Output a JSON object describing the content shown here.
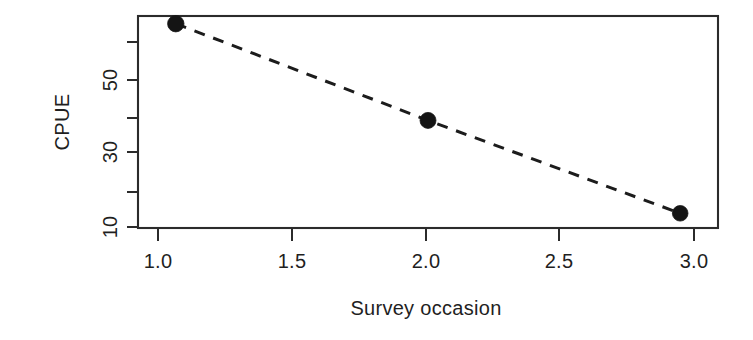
{
  "chart_data": {
    "type": "line",
    "title": "",
    "subtitle": "",
    "xlabel": "Survey occasion",
    "ylabel": "CPUE",
    "x": [
      1.0,
      2.0,
      3.0
    ],
    "values": [
      63,
      24,
      9.5
    ],
    "series": [
      {
        "name": "CPUE",
        "x": [
          1.0,
          2.0,
          3.0
        ],
        "values": [
          63,
          24,
          9.5
        ],
        "marker": "filled-circle",
        "linestyle": "dashed",
        "color": "#141414"
      }
    ],
    "xlim": [
      0.85,
      3.15
    ],
    "ylim": [
      8.2,
      68
    ],
    "yscale": "log",
    "xscale": "linear",
    "grid": false,
    "legend": false,
    "legend_position": "none",
    "frame": "box",
    "xticks": [
      {
        "value": 1.0,
        "label": "1.0"
      },
      {
        "value": 1.5,
        "label": "1.5"
      },
      {
        "value": 2.0,
        "label": "2.0"
      },
      {
        "value": 2.5,
        "label": "2.5"
      },
      {
        "value": 3.0,
        "label": "3.0"
      }
    ],
    "yticks": [
      {
        "value": 60,
        "label": ""
      },
      {
        "value": 50,
        "label": "50"
      },
      {
        "value": 40,
        "label": ""
      },
      {
        "value": 30,
        "label": "30"
      },
      {
        "value": 20,
        "label": ""
      },
      {
        "value": 10,
        "label": "10"
      }
    ],
    "annotations": []
  },
  "axes": {
    "x_title": "Survey occasion",
    "y_title": "CPUE",
    "x_tick_labels": [
      "1.0",
      "1.5",
      "2.0",
      "2.5",
      "3.0"
    ],
    "y_tick_labels": [
      "50",
      "30",
      "10"
    ]
  },
  "colors": {
    "ink": "#1f1f1f",
    "frame": "#2b2b2b",
    "marker": "#141414",
    "background": "#ffffff"
  }
}
